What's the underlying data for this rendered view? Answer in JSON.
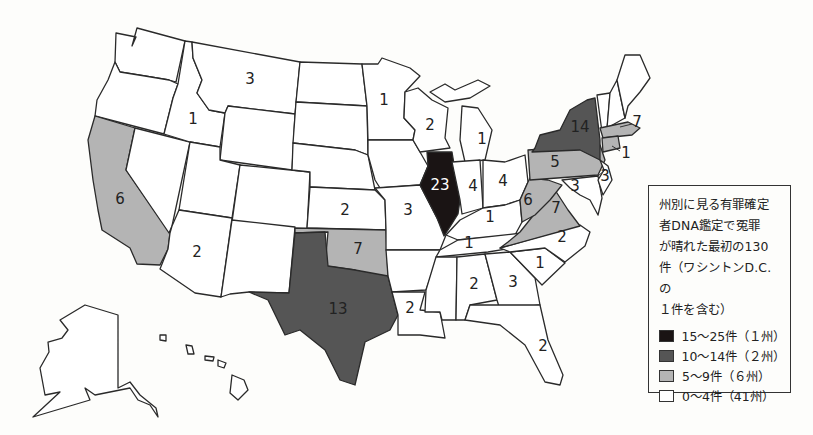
{
  "legend": {
    "title_lines": [
      "州別に見る有罪確定",
      "者DNA鑑定で冤罪",
      "が晴れた最初の130",
      "件（ワシントンD.C.の",
      "１件を含む）"
    ],
    "items": [
      {
        "label": "15〜25件（１州）",
        "color": "#1a1414"
      },
      {
        "label": "10〜14件（２州）",
        "color": "#555555"
      },
      {
        "label": "5〜9件（６州）",
        "color": "#b4b4b4"
      },
      {
        "label": "0〜4件（41州）",
        "color": "#ffffff"
      }
    ]
  },
  "colors": {
    "tier1": "#1a1414",
    "tier2": "#555555",
    "tier3": "#b4b4b4",
    "tier4": "#ffffff"
  },
  "state_counts": {
    "Montana": "3",
    "Idaho": "1",
    "Minnesota": "1",
    "Wisconsin": "2",
    "Michigan": "1",
    "California": "6",
    "Arizona": "2",
    "Kansas": "2",
    "Missouri": "3",
    "Illinois": "23",
    "Indiana": "4",
    "Ohio": "4",
    "Kentucky": "1",
    "Tennessee": "1",
    "West Virginia": "6",
    "Virginia": "7",
    "Pennsylvania": "5",
    "New York": "14",
    "Massachusetts": "7",
    "Connecticut": "1",
    "New Jersey": "3",
    "Maryland": "3",
    "North Carolina": "2",
    "South Carolina": "1",
    "Georgia": "3",
    "Alabama": "2",
    "Louisiana": "2",
    "Florida": "2",
    "Oklahoma": "7",
    "Texas": "13"
  }
}
